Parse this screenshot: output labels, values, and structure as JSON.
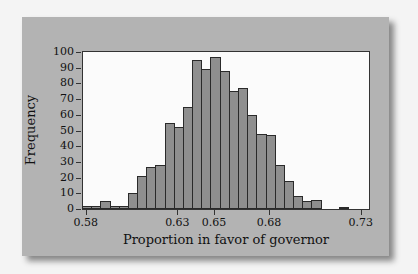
{
  "chart_data": {
    "type": "bar",
    "title": "",
    "xlabel": "Proportion in favor of governor",
    "ylabel": "Frequency",
    "ylim": [
      0,
      100
    ],
    "yticks": [
      0,
      10,
      20,
      30,
      40,
      50,
      60,
      70,
      80,
      90,
      100
    ],
    "xticks": [
      "0.58",
      "0.63",
      "0.65",
      "0.68",
      "0.73"
    ],
    "xlim": [
      0.578,
      0.735
    ],
    "bin_width": 0.005,
    "categories": [
      "0.580",
      "0.585",
      "0.590",
      "0.595",
      "0.600",
      "0.605",
      "0.610",
      "0.615",
      "0.620",
      "0.625",
      "0.630",
      "0.635",
      "0.640",
      "0.645",
      "0.650",
      "0.655",
      "0.660",
      "0.665",
      "0.670",
      "0.675",
      "0.680",
      "0.685",
      "0.690",
      "0.695",
      "0.700",
      "0.705",
      "0.710",
      "0.715",
      "0.720"
    ],
    "values": [
      2,
      2,
      5,
      2,
      2,
      10,
      21,
      27,
      28,
      55,
      52,
      65,
      95,
      89,
      97,
      88,
      75,
      77,
      60,
      48,
      47,
      28,
      18,
      8,
      5,
      6,
      0,
      0,
      1
    ],
    "grid": false,
    "legend": null
  },
  "colors": {
    "bar_fill": "#8f8f8f",
    "bar_edge": "#2a2a2a",
    "card_bg": "#b3b3b3",
    "plot_bg": "#fbfbfb"
  }
}
